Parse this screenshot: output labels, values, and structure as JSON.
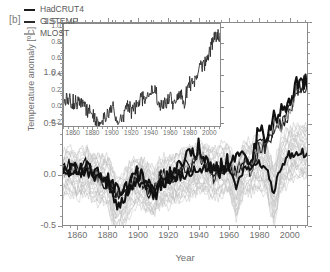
{
  "panel": {
    "label": "[b]"
  },
  "axes": {
    "ylabel": "Temperature anomaly [ºC]",
    "xlabel": "Year",
    "yticks": [
      "-0.5",
      "0.0",
      "0.5",
      "1.0",
      "1.5"
    ],
    "xticks": [
      "1860",
      "1880",
      "1900",
      "1920",
      "1940",
      "1960",
      "1980",
      "2000"
    ]
  },
  "inset": {
    "yticks": [
      "-0.2",
      "0.0",
      "0.2",
      "0.4",
      "0.6",
      "0.8",
      "1.0"
    ],
    "xticks": [
      "1860",
      "1880",
      "1900",
      "1920",
      "1940",
      "1960",
      "1980",
      "2000"
    ]
  },
  "legend": {
    "items": [
      {
        "label": "HadCRUT4",
        "color": "#1c1c1c"
      },
      {
        "label": "GISTEMP",
        "color": "#2a2a2a"
      },
      {
        "label": "MLOST",
        "color": "#9e9e9e"
      }
    ]
  },
  "colors": {
    "spread": "#bdbdbd",
    "dark": "#111111",
    "mid": "#3a3a3a",
    "light": "#9e9e9e",
    "frame": "#8a8a8a",
    "text": "#6f6f6f"
  },
  "chart_data": {
    "type": "line",
    "title": "",
    "xlabel": "Year",
    "ylabel": "Temperature anomaly [ºC]",
    "xlim": [
      1850,
      2012
    ],
    "ylim": [
      -0.5,
      1.5
    ],
    "grid": false,
    "legend_position": "top-left",
    "x": [
      1850,
      1855,
      1860,
      1865,
      1870,
      1875,
      1880,
      1885,
      1890,
      1895,
      1900,
      1905,
      1910,
      1915,
      1920,
      1925,
      1930,
      1935,
      1940,
      1945,
      1950,
      1955,
      1960,
      1965,
      1970,
      1975,
      1980,
      1985,
      1990,
      1995,
      2000,
      2005,
      2010,
      2012
    ],
    "series": [
      {
        "name": "HadCRUT4",
        "color": "#111111",
        "values": [
          0.06,
          0.1,
          0.05,
          0.08,
          0.02,
          -0.05,
          -0.12,
          -0.22,
          -0.18,
          -0.1,
          0.02,
          -0.14,
          -0.2,
          0.0,
          -0.06,
          0.0,
          0.1,
          0.06,
          0.22,
          0.16,
          0.02,
          0.04,
          0.1,
          0.02,
          0.16,
          0.06,
          0.32,
          0.28,
          0.5,
          0.52,
          0.62,
          0.88,
          0.92,
          0.86
        ]
      },
      {
        "name": "GISTEMP",
        "color": "#2a2a2a",
        "values": [
          0.04,
          0.06,
          0.02,
          0.06,
          0.0,
          -0.04,
          -0.1,
          -0.18,
          -0.16,
          -0.12,
          0.0,
          -0.12,
          -0.18,
          -0.02,
          -0.04,
          0.02,
          0.08,
          0.04,
          0.18,
          0.14,
          0.0,
          0.02,
          0.08,
          0.0,
          0.14,
          0.04,
          0.3,
          0.26,
          0.46,
          0.48,
          0.58,
          0.82,
          0.88,
          0.82
        ]
      },
      {
        "name": "MLOST",
        "color": "#9e9e9e",
        "values": [
          0.05,
          0.08,
          0.04,
          0.07,
          0.01,
          -0.05,
          -0.11,
          -0.2,
          -0.17,
          -0.11,
          0.01,
          -0.13,
          -0.19,
          -0.01,
          -0.05,
          0.01,
          0.09,
          0.05,
          0.2,
          0.15,
          0.01,
          0.03,
          0.09,
          0.01,
          0.15,
          0.05,
          0.31,
          0.27,
          0.48,
          0.5,
          0.6,
          0.85,
          0.9,
          0.84
        ]
      },
      {
        "name": "model-ensemble-mean",
        "color": "#111111",
        "values": [
          0.0,
          0.02,
          0.0,
          0.04,
          -0.02,
          -0.04,
          -0.05,
          -0.3,
          -0.26,
          -0.12,
          -0.06,
          -0.1,
          -0.16,
          -0.06,
          -0.06,
          -0.02,
          0.0,
          0.02,
          0.06,
          0.06,
          0.02,
          0.04,
          0.06,
          -0.12,
          0.06,
          0.06,
          0.1,
          0.06,
          -0.18,
          0.1,
          0.18,
          0.22,
          0.22,
          0.22
        ]
      }
    ],
    "spread_band": {
      "name": "model-ensemble-spread",
      "color": "#bdbdbd",
      "lower": [
        -0.22,
        -0.2,
        -0.22,
        -0.18,
        -0.24,
        -0.28,
        -0.3,
        -0.62,
        -0.5,
        -0.36,
        -0.3,
        -0.34,
        -0.42,
        -0.3,
        -0.3,
        -0.26,
        -0.24,
        -0.22,
        -0.18,
        -0.18,
        -0.22,
        -0.2,
        -0.18,
        -0.42,
        -0.18,
        -0.18,
        -0.14,
        -0.18,
        -0.48,
        -0.16,
        -0.06,
        -0.02,
        -0.02,
        -0.02
      ],
      "upper": [
        0.22,
        0.24,
        0.22,
        0.26,
        0.2,
        0.18,
        0.18,
        -0.02,
        0.0,
        0.12,
        0.16,
        0.12,
        0.06,
        0.16,
        0.16,
        0.2,
        0.24,
        0.26,
        0.3,
        0.3,
        0.26,
        0.28,
        0.3,
        0.1,
        0.3,
        0.32,
        0.36,
        0.32,
        0.08,
        0.38,
        0.44,
        0.48,
        0.48,
        0.48
      ]
    },
    "inset": {
      "type": "line",
      "xlim": [
        1850,
        2012
      ],
      "ylim": [
        -0.25,
        1.05
      ],
      "description": "Observational records only, enlarged vertical scale",
      "series": [
        {
          "name": "HadCRUT4",
          "color": "#2a2a2a",
          "values": [
            0.06,
            0.1,
            0.05,
            0.08,
            0.02,
            -0.05,
            -0.12,
            -0.22,
            -0.18,
            -0.1,
            0.02,
            -0.14,
            -0.2,
            0.0,
            -0.06,
            0.0,
            0.1,
            0.06,
            0.22,
            0.16,
            0.02,
            0.04,
            0.1,
            0.02,
            0.16,
            0.06,
            0.32,
            0.28,
            0.5,
            0.52,
            0.62,
            0.88,
            0.92,
            0.86
          ]
        }
      ]
    }
  }
}
